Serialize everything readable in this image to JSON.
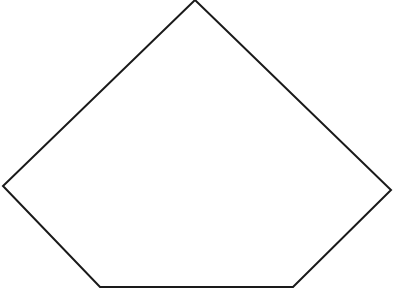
{
  "figure": {
    "shape": "pentagon",
    "stroke_color": "#1a1a1a",
    "fill_color": "#ffffff",
    "stroke_width": 2,
    "vertices": [
      [
        195,
        0
      ],
      [
        391,
        190
      ],
      [
        293,
        287
      ],
      [
        100,
        287
      ],
      [
        3,
        186
      ]
    ]
  },
  "caption": {
    "text": ""
  }
}
